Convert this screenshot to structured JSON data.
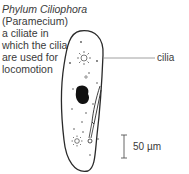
{
  "caption": {
    "title": "Phylum Ciliophora",
    "lines": [
      "(Paramecium)",
      "a ciliate in",
      "which the cilia",
      "are used for",
      "locomotion"
    ]
  },
  "labels": {
    "cilia": "cilia",
    "scale": "50 µm"
  },
  "colors": {
    "outline": "#2a2a2a",
    "nucleus": "#111111",
    "leader_line": "#888888",
    "text": "#3a3a3a"
  }
}
